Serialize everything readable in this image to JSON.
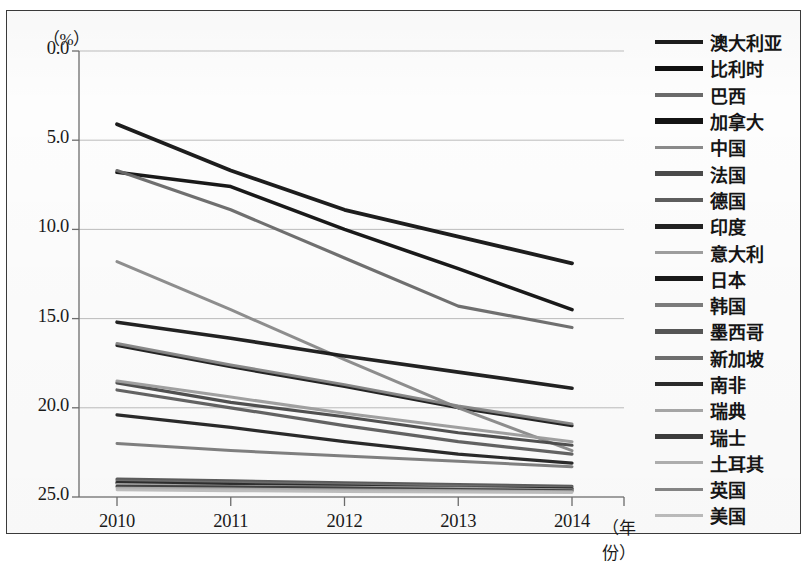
{
  "axis": {
    "y_unit": "（%）",
    "x_name": "（年份）",
    "y_ticks": [
      "25.0",
      "20.0",
      "15.0",
      "10.0",
      "5.0",
      "0.0"
    ],
    "x_ticks": [
      "2010",
      "2011",
      "2012",
      "2013",
      "2014"
    ]
  },
  "chart_data": {
    "type": "line",
    "title": "",
    "xlabel": "（年份）",
    "ylabel": "（%）",
    "x": [
      2010,
      2011,
      2012,
      2013,
      2014
    ],
    "xlim": [
      2010,
      2014
    ],
    "ylim": [
      0.0,
      25.0
    ],
    "ytick_values": [
      0.0,
      5.0,
      10.0,
      15.0,
      20.0,
      25.0
    ],
    "grid": "horizontal",
    "legend_position": "right",
    "series": [
      {
        "name": "澳大利亚",
        "color": "#1c1c1c",
        "width": 3.2,
        "values": [
          8.5,
          7.3,
          6.2,
          5.0,
          4.0
        ]
      },
      {
        "name": "比利时",
        "color": "#101010",
        "width": 3.6,
        "values": [
          18.2,
          17.4,
          15.0,
          12.8,
          10.5
        ]
      },
      {
        "name": "巴西",
        "color": "#6a6a6a",
        "width": 3.2,
        "values": [
          18.3,
          16.1,
          13.4,
          10.7,
          9.5
        ]
      },
      {
        "name": "加拿大",
        "color": "#141414",
        "width": 3.8,
        "values": [
          20.9,
          18.3,
          16.1,
          14.6,
          13.1
        ]
      },
      {
        "name": "中国",
        "color": "#8a8a8a",
        "width": 3.0,
        "values": [
          13.2,
          10.5,
          7.7,
          5.0,
          2.6
        ]
      },
      {
        "name": "法国",
        "color": "#4a4a4a",
        "width": 3.2,
        "values": [
          6.4,
          5.3,
          4.5,
          3.6,
          2.9
        ]
      },
      {
        "name": "德国",
        "color": "#5e5e5e",
        "width": 3.2,
        "values": [
          6.0,
          5.0,
          4.0,
          3.1,
          2.4
        ]
      },
      {
        "name": "印度",
        "color": "#222222",
        "width": 3.2,
        "values": [
          4.6,
          3.9,
          3.1,
          2.4,
          1.9
        ]
      },
      {
        "name": "意大利",
        "color": "#9e9e9e",
        "width": 3.0,
        "values": [
          6.5,
          5.6,
          4.7,
          3.9,
          3.1
        ]
      },
      {
        "name": "日本",
        "color": "#191919",
        "width": 3.6,
        "values": [
          9.8,
          8.9,
          7.9,
          7.0,
          6.1
        ]
      },
      {
        "name": "韩国",
        "color": "#7c7c7c",
        "width": 3.0,
        "values": [
          3.0,
          2.6,
          2.3,
          2.0,
          1.7
        ]
      },
      {
        "name": "墨西哥",
        "color": "#565656",
        "width": 3.2,
        "values": [
          1.0,
          0.9,
          0.8,
          0.7,
          0.6
        ]
      },
      {
        "name": "新加坡",
        "color": "#6f6f6f",
        "width": 3.0,
        "values": [
          0.9,
          0.8,
          0.7,
          0.6,
          0.5
        ]
      },
      {
        "name": "南非",
        "color": "#2b2b2b",
        "width": 3.4,
        "values": [
          0.8,
          0.7,
          0.6,
          0.5,
          0.45
        ]
      },
      {
        "name": "瑞典",
        "color": "#a8a8a8",
        "width": 2.8,
        "values": [
          0.7,
          0.6,
          0.55,
          0.5,
          0.4
        ]
      },
      {
        "name": "瑞士",
        "color": "#3d3d3d",
        "width": 3.2,
        "values": [
          0.6,
          0.55,
          0.5,
          0.42,
          0.35
        ]
      },
      {
        "name": "土耳其",
        "color": "#b0b0b0",
        "width": 2.8,
        "values": [
          0.5,
          0.45,
          0.4,
          0.35,
          0.3
        ]
      },
      {
        "name": "英国",
        "color": "#868686",
        "width": 3.0,
        "values": [
          8.6,
          7.4,
          6.3,
          5.1,
          4.1
        ]
      },
      {
        "name": "美国",
        "color": "#bdbdbd",
        "width": 2.8,
        "values": [
          0.4,
          0.35,
          0.3,
          0.28,
          0.25
        ]
      }
    ]
  },
  "legend": {
    "items": [
      {
        "label": "澳大利亚",
        "color": "#1c1c1c",
        "weight": 4.6
      },
      {
        "label": "比利时",
        "color": "#101010",
        "weight": 5.2
      },
      {
        "label": "巴西",
        "color": "#6a6a6a",
        "weight": 4.2
      },
      {
        "label": "加拿大",
        "color": "#141414",
        "weight": 5.4
      },
      {
        "label": "中国",
        "color": "#8a8a8a",
        "weight": 3.6
      },
      {
        "label": "法国",
        "color": "#4a4a4a",
        "weight": 4.4
      },
      {
        "label": "德国",
        "color": "#5e5e5e",
        "weight": 4.4
      },
      {
        "label": "印度",
        "color": "#222222",
        "weight": 4.8
      },
      {
        "label": "意大利",
        "color": "#9e9e9e",
        "weight": 3.4
      },
      {
        "label": "日本",
        "color": "#191919",
        "weight": 5.0
      },
      {
        "label": "韩国",
        "color": "#7c7c7c",
        "weight": 3.6
      },
      {
        "label": "墨西哥",
        "color": "#565656",
        "weight": 4.2
      },
      {
        "label": "新加坡",
        "color": "#6f6f6f",
        "weight": 4.2
      },
      {
        "label": "南非",
        "color": "#2b2b2b",
        "weight": 4.6
      },
      {
        "label": "瑞典",
        "color": "#a8a8a8",
        "weight": 3.0
      },
      {
        "label": "瑞士",
        "color": "#3d3d3d",
        "weight": 4.4
      },
      {
        "label": "土耳其",
        "color": "#b0b0b0",
        "weight": 3.0
      },
      {
        "label": "英国",
        "color": "#868686",
        "weight": 3.4
      },
      {
        "label": "美国",
        "color": "#bdbdbd",
        "weight": 3.0
      }
    ]
  }
}
